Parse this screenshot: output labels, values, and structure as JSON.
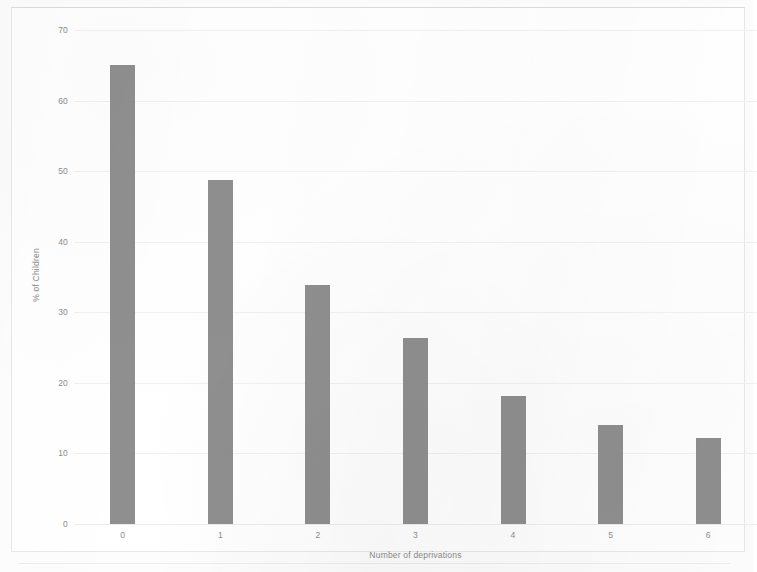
{
  "chart_data": {
    "type": "bar",
    "title": "",
    "categories": [
      "0",
      "1",
      "2",
      "3",
      "4",
      "5",
      "6"
    ],
    "values": [
      65.0,
      48.7,
      33.9,
      26.4,
      18.1,
      14.1,
      12.2
    ],
    "xlabel": "Number of deprivations",
    "ylabel": "% of Children",
    "ylim": [
      0,
      70
    ],
    "xlim": [
      -0.5,
      6.5
    ],
    "y_ticks": [
      "0",
      "10",
      "20",
      "30",
      "40",
      "50",
      "60",
      "70"
    ],
    "y_tick_values": [
      0,
      10,
      20,
      30,
      40,
      50,
      60,
      70
    ],
    "grid": "horizontal",
    "legend": "none",
    "bar_color": "#808080",
    "gridline_color": "#f1f1f1",
    "tick_label_color": "#8d8d8d",
    "axis_title_color": "#8a8a8a",
    "background_color": "#ffffff",
    "frame_color": "#e8e8e8"
  }
}
